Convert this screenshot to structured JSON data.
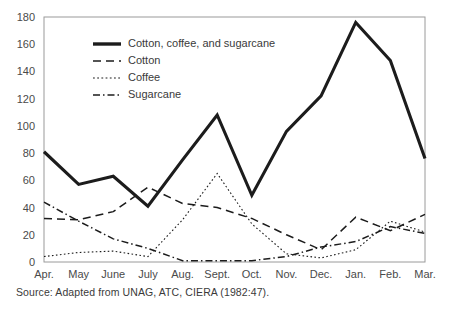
{
  "source_note": "Source: Adapted from UNAG, ATC, CIERA (1982:47).",
  "chart_data": {
    "type": "line",
    "title": "",
    "xlabel": "",
    "ylabel": "",
    "ylim": [
      0,
      180
    ],
    "yticks": [
      0,
      20,
      40,
      60,
      80,
      100,
      120,
      140,
      160,
      180
    ],
    "ytick_labels": [
      "0",
      "20",
      "40",
      "60",
      "80",
      "100",
      "120",
      "140",
      "160",
      "180"
    ],
    "grid": false,
    "legend_position": "upper-left-inside",
    "categories": [
      "Apr.",
      "May",
      "June",
      "July",
      "Aug.",
      "Sept.",
      "Oct.",
      "Nov.",
      "Dec.",
      "Jan.",
      "Feb.",
      "Mar."
    ],
    "series": [
      {
        "name": "Cotton, coffee, and sugarcane",
        "style": "solid",
        "values": [
          81,
          57,
          63,
          41,
          75,
          108,
          49,
          96,
          122,
          176,
          148,
          76
        ]
      },
      {
        "name": "Cotton",
        "style": "dashed",
        "values": [
          32,
          31,
          37,
          55,
          43,
          40,
          32,
          20,
          9,
          33,
          23,
          35
        ]
      },
      {
        "name": "Coffee",
        "style": "dotted",
        "values": [
          4,
          7,
          8,
          4,
          31,
          65,
          28,
          6,
          3,
          9,
          30,
          22
        ]
      },
      {
        "name": "Sugarcane",
        "style": "dash-dot",
        "values": [
          44,
          30,
          17,
          10,
          1,
          1,
          1,
          4,
          11,
          15,
          26,
          21
        ]
      }
    ]
  }
}
